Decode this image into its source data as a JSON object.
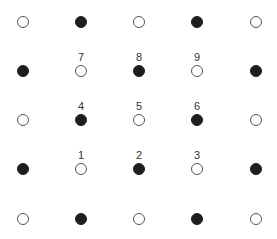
{
  "diagram": {
    "columns_x": [
      23,
      81,
      139,
      197,
      256
    ],
    "rows_y": [
      22,
      71,
      120,
      169,
      219
    ],
    "colors": {
      "filled": "#1e1e1e",
      "open_stroke": "#555555",
      "label": "#333333"
    },
    "grid": [
      [
        {
          "fill": "open"
        },
        {
          "fill": "filled"
        },
        {
          "fill": "open"
        },
        {
          "fill": "filled"
        },
        {
          "fill": "open"
        }
      ],
      [
        {
          "fill": "filled"
        },
        {
          "fill": "open",
          "label": "7"
        },
        {
          "fill": "filled",
          "label": "8"
        },
        {
          "fill": "open",
          "label": "9"
        },
        {
          "fill": "filled"
        }
      ],
      [
        {
          "fill": "open"
        },
        {
          "fill": "filled",
          "label": "4"
        },
        {
          "fill": "open",
          "label": "5"
        },
        {
          "fill": "filled",
          "label": "6"
        },
        {
          "fill": "open"
        }
      ],
      [
        {
          "fill": "filled"
        },
        {
          "fill": "open",
          "label": "1"
        },
        {
          "fill": "filled",
          "label": "2"
        },
        {
          "fill": "open",
          "label": "3"
        },
        {
          "fill": "filled"
        }
      ],
      [
        {
          "fill": "open"
        },
        {
          "fill": "filled"
        },
        {
          "fill": "open"
        },
        {
          "fill": "filled"
        },
        {
          "fill": "open"
        }
      ]
    ]
  }
}
